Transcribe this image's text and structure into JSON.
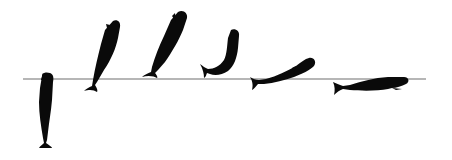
{
  "illustration": {
    "subject": "sperm whale breaching sequence",
    "background_color": "#ffffff",
    "silhouette_color": "#0a0a0a",
    "waterline": {
      "color": "#6e6e6e",
      "x1": 23,
      "x2": 426,
      "y": 79
    },
    "stages": [
      {
        "index": 1,
        "pose": "vertical rising, head at surface"
      },
      {
        "index": 2,
        "pose": "steep ascent out of water"
      },
      {
        "index": 3,
        "pose": "airborne, tail near surface"
      },
      {
        "index": 4,
        "pose": "arching over, head up"
      },
      {
        "index": 5,
        "pose": "falling back, near horizontal"
      },
      {
        "index": 6,
        "pose": "horizontal at surface"
      }
    ]
  }
}
